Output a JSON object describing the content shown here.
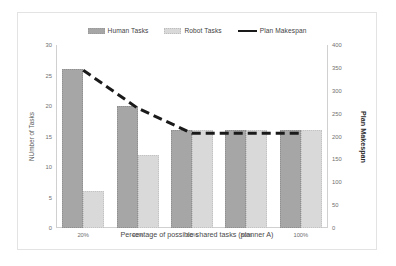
{
  "chart_data": {
    "type": "bar",
    "title": "",
    "categories": [
      "20%",
      "40%",
      "60%",
      "80%",
      "100%"
    ],
    "series": [
      {
        "name": "Human Tasks",
        "type": "bar",
        "axis": "left",
        "color": "#a6a6a6",
        "values": [
          26,
          20,
          16,
          16,
          16
        ]
      },
      {
        "name": "Robot Tasks",
        "type": "bar",
        "axis": "left",
        "color": "#d9d9d9",
        "values": [
          6,
          12,
          16,
          16,
          16
        ]
      },
      {
        "name": "Plan Makespan",
        "type": "line",
        "axis": "right",
        "color": "#1a1a1a",
        "values": [
          345,
          262,
          207,
          207,
          207
        ]
      }
    ],
    "xlabel": "Percentage of possible shared tasks (planner A)",
    "ylabel": "NUmber of Tasks",
    "ylabel_secondary": "Plan Makespan",
    "ylim": [
      0,
      30
    ],
    "yticks": [
      0,
      5,
      10,
      15,
      20,
      25,
      30
    ],
    "ylim_secondary": [
      0,
      400
    ],
    "yticks_secondary": [
      0,
      50,
      100,
      150,
      200,
      250,
      300,
      350,
      400
    ],
    "grid": false,
    "legend_position": "top"
  },
  "legend": {
    "items": [
      {
        "label": "Human Tasks",
        "marker": "bar-swatch-dark"
      },
      {
        "label": "Robot Tasks",
        "marker": "bar-swatch-light"
      },
      {
        "label": "Plan Makespan",
        "marker": "line-swatch-black"
      }
    ]
  }
}
